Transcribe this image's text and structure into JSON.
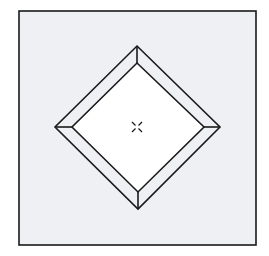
{
  "diagram": {
    "type": "beveled-diamond-in-square",
    "colors": {
      "background": "#ffffff",
      "frame_fill": "#eef0f3",
      "bevel_fill": "#eef0f3",
      "inner_fill": "#ffffff",
      "stroke": "#1a1a1a"
    },
    "frame": {
      "x": 19,
      "y": 11,
      "width": 237,
      "height": 234
    },
    "outer_diamond": {
      "top": [
        137,
        46
      ],
      "right": [
        220,
        127
      ],
      "bottom": [
        138,
        209
      ],
      "left": [
        55,
        127
      ]
    },
    "inner_diamond": {
      "top": [
        137,
        63
      ],
      "right": [
        204,
        127
      ],
      "bottom": [
        138,
        192
      ],
      "left": [
        72,
        127
      ]
    },
    "center_marker": {
      "shape": "x-cross",
      "cx": 137,
      "cy": 127,
      "size": 5
    }
  }
}
